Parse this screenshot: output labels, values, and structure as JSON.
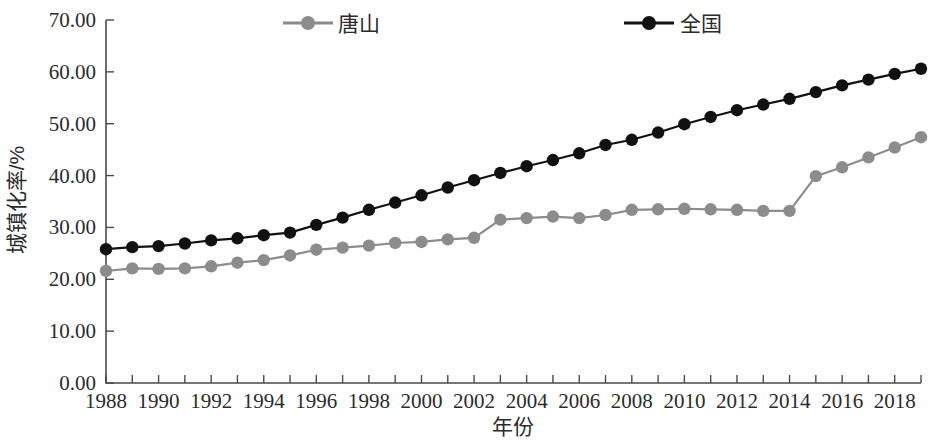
{
  "chart_data": {
    "type": "line",
    "title": "",
    "xlabel": "年份",
    "ylabel": "城镇化率/%",
    "xlim": [
      1988,
      2019
    ],
    "ylim": [
      0,
      70
    ],
    "ytick_labels": [
      "0.00",
      "10.00",
      "20.00",
      "30.00",
      "40.00",
      "50.00",
      "60.00",
      "70.00"
    ],
    "ytick_values": [
      0,
      10,
      20,
      30,
      40,
      50,
      60,
      70
    ],
    "xtick_labels": [
      "1988",
      "1990",
      "1992",
      "1994",
      "1996",
      "1998",
      "2000",
      "2002",
      "2004",
      "2006",
      "2008",
      "2010",
      "2012",
      "2014",
      "2016",
      "2018"
    ],
    "xtick_values": [
      1988,
      1990,
      1992,
      1994,
      1996,
      1998,
      2000,
      2002,
      2004,
      2006,
      2008,
      2010,
      2012,
      2014,
      2016,
      2018
    ],
    "grid": false,
    "legend_position": "top-center",
    "x": [
      1988,
      1989,
      1990,
      1991,
      1992,
      1993,
      1994,
      1995,
      1996,
      1997,
      1998,
      1999,
      2000,
      2001,
      2002,
      2003,
      2004,
      2005,
      2006,
      2007,
      2008,
      2009,
      2010,
      2011,
      2012,
      2013,
      2014,
      2015,
      2016,
      2017,
      2018,
      2019
    ],
    "series": [
      {
        "name": "唐山",
        "color": "#8c8c8c",
        "marker": "circle",
        "values": [
          21.6,
          22.1,
          22.0,
          22.1,
          22.5,
          23.2,
          23.7,
          24.6,
          25.7,
          26.1,
          26.5,
          27.0,
          27.2,
          27.7,
          28.0,
          31.5,
          31.8,
          32.1,
          31.8,
          32.4,
          33.4,
          33.5,
          33.6,
          33.5,
          33.4,
          33.2,
          33.2,
          39.9,
          41.6,
          43.5,
          45.4,
          47.4
        ]
      },
      {
        "name": "全国",
        "color": "#111111",
        "marker": "circle",
        "values": [
          25.8,
          26.2,
          26.4,
          26.9,
          27.5,
          27.9,
          28.5,
          29.0,
          30.5,
          31.9,
          33.4,
          34.8,
          36.2,
          37.7,
          39.1,
          40.5,
          41.8,
          43.0,
          44.3,
          45.9,
          46.9,
          48.3,
          49.9,
          51.3,
          52.6,
          53.7,
          54.8,
          56.1,
          57.4,
          58.5,
          59.6,
          60.6
        ]
      }
    ],
    "legend": [
      {
        "label": "唐山",
        "color": "#8c8c8c"
      },
      {
        "label": "全国",
        "color": "#111111"
      }
    ]
  }
}
